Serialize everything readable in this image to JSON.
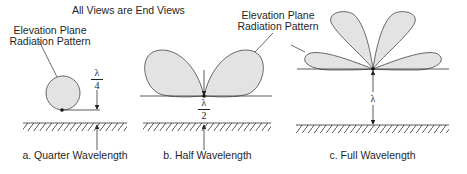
{
  "title": "All Views are End Views",
  "panels": [
    {
      "id": "a",
      "caption": "a. Quarter Wavelength",
      "pattern_label_line1": "Elevation Plane",
      "pattern_label_line2": "Radiation Pattern",
      "height_num": "λ",
      "height_den": "4",
      "lobes": 1
    },
    {
      "id": "b",
      "caption": "b. Half Wavelength",
      "height_num": "λ",
      "height_den": "2",
      "lobes": 2
    },
    {
      "id": "c",
      "caption": "c. Full Wavelength",
      "pattern_label_line1": "Elevation Plane",
      "pattern_label_line2": "Radiation Pattern",
      "height_label": "λ",
      "lobes": 4
    }
  ],
  "colors": {
    "lobe_fill": "#e3e3e3",
    "stroke": "#333333"
  }
}
